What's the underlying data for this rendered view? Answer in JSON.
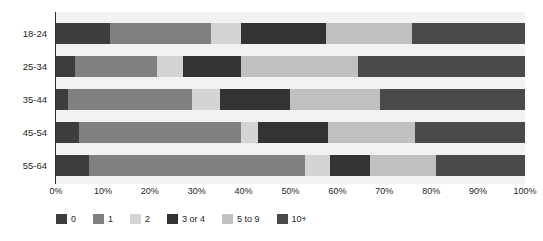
{
  "chart_data": {
    "type": "bar",
    "orientation": "horizontal",
    "stacked": true,
    "normalized": true,
    "title": "",
    "xlabel": "",
    "ylabel": "",
    "xlim": [
      0,
      100
    ],
    "grid": false,
    "legend_position": "bottom",
    "categories": [
      "18-24",
      "25-34",
      "35-44",
      "45-54",
      "55-64"
    ],
    "xtick_labels": [
      "0%",
      "10%",
      "20%",
      "30%",
      "40%",
      "50%",
      "60%",
      "70%",
      "80%",
      "90%",
      "100%"
    ],
    "xtick_values": [
      0,
      10,
      20,
      30,
      40,
      50,
      60,
      70,
      80,
      90,
      100
    ],
    "series": [
      {
        "name": "0",
        "color": "#3d3d3d",
        "values": [
          11.5,
          4.0,
          2.5,
          5.0,
          7.0
        ]
      },
      {
        "name": "1",
        "color": "#808080",
        "values": [
          21.5,
          17.5,
          26.5,
          34.5,
          46.0
        ]
      },
      {
        "name": "2",
        "color": "#d4d4d4",
        "values": [
          6.5,
          5.5,
          6.0,
          3.5,
          5.5
        ]
      },
      {
        "name": "3 or 4",
        "color": "#333333",
        "values": [
          18.0,
          12.5,
          15.0,
          15.0,
          8.5
        ]
      },
      {
        "name": "5 to 9",
        "color": "#c0c0c0",
        "values": [
          18.5,
          25.0,
          19.0,
          18.5,
          14.0
        ]
      },
      {
        "name": "10+",
        "color": "#4a4a4a",
        "values": [
          24.0,
          35.5,
          31.0,
          23.5,
          19.0
        ]
      }
    ]
  },
  "legend": {
    "items": [
      {
        "label": "0"
      },
      {
        "label": "1"
      },
      {
        "label": "2"
      },
      {
        "label": "3 or 4"
      },
      {
        "label": "5 to 9"
      },
      {
        "label": "10+"
      }
    ]
  },
  "colors": {
    "plot_background": "#f2f2f2",
    "page_background": "#ffffff",
    "axis": "#2b2b2b",
    "text": "#262626"
  }
}
